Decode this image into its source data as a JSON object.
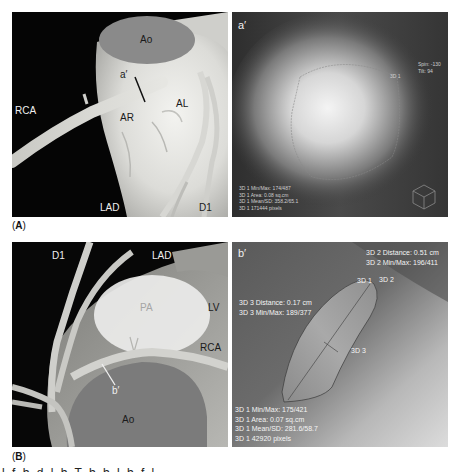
{
  "panel_a": {
    "figure_label_open": "(",
    "figure_label_letter": "A",
    "figure_label_close": ")",
    "labels": {
      "ao": "Ao",
      "a_prime": "a′",
      "rca": "RCA",
      "ar": "AR",
      "al": "AL",
      "lad": "LAD",
      "d1": "D1"
    }
  },
  "panel_a_prime": {
    "corner_label": "a′",
    "roi_label": "3D 1",
    "orientation": [
      "Spin: -130",
      "Tilt: 94"
    ],
    "stats": [
      "3D 1 Min/Max: 174/487",
      "3D 1 Area: 0.08 sq.cm",
      "3D 1 Mean/SD: 358.2/65.1",
      "3D 1     171444 pixels"
    ],
    "orientation_cube_icon": "cube-icon"
  },
  "panel_b": {
    "figure_label_open": "(",
    "figure_label_letter": "B",
    "figure_label_close": ")",
    "labels": {
      "d1": "D1",
      "lad": "LAD",
      "pa": "PA",
      "lv": "LV",
      "rca": "RCA",
      "b_prime": "b′",
      "ao": "Ao"
    }
  },
  "panel_b_prime": {
    "corner_label": "b′",
    "top_right": [
      "3D 2 Distance: 0.51 cm",
      "3D 2 Min/Max: 196/411"
    ],
    "roi_labels": {
      "roi1": "3D 1",
      "roi2": "3D 2",
      "roi3": "3D 3"
    },
    "left_mid": [
      "3D 3 Distance: 0.17 cm",
      "3D 3 Min/Max: 189/377"
    ],
    "stats": [
      "3D 1 Min/Max: 175/421",
      "3D 1 Area: 0.07 sq.cm",
      "3D 1 Mean/SD: 281.6/58.7",
      "3D 1     42920 pixels"
    ]
  },
  "caption_fragment": "l                 f        b     d   l   b   T           b                    b        l         b         f   l     "
}
